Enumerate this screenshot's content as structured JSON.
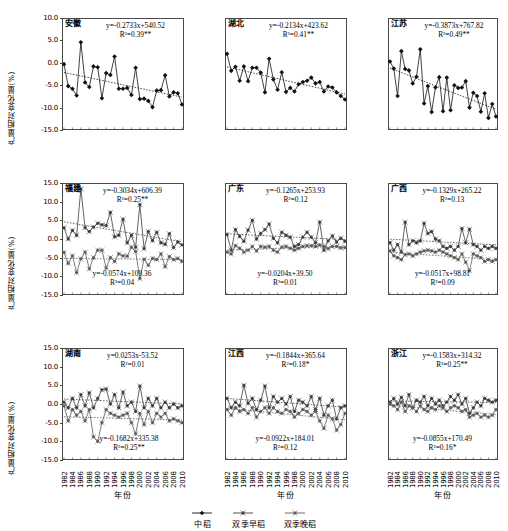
{
  "figure": {
    "y_axis_title": "产量相对变化量(%)",
    "x_axis_title": "年份",
    "y_ticks_top": [
      "10.0",
      "5.0",
      "0.0",
      "-5.0",
      "-10.0",
      "-15.0"
    ],
    "y_ticks_other": [
      "15.0",
      "10.0",
      "5.0",
      "0.0",
      "-5.0",
      "-10.0",
      "-15.0"
    ],
    "x_ticks": [
      "1982",
      "1984",
      "1986",
      "1988",
      "1990",
      "1992",
      "1994",
      "1996",
      "1998",
      "2000",
      "2002",
      "2004",
      "2006",
      "2008",
      "2010"
    ],
    "legend": [
      {
        "label": "中稻",
        "marker": "diamond",
        "color": "#000000"
      },
      {
        "label": "双季早稻",
        "marker": "diamond",
        "color": "#3a3a3a"
      },
      {
        "label": "双季晚稻",
        "marker": "diamond",
        "color": "#5a5a5a"
      }
    ]
  },
  "chart_data": [
    {
      "type": "line",
      "title": "安徽",
      "xlabel": "年份",
      "ylabel": "产量相对变化量(%)",
      "ylim": [
        -15,
        10
      ],
      "xlim": [
        1982,
        2010
      ],
      "grid": false,
      "annotations": [
        {
          "equation": "y=-0.2733x+540.52",
          "r2": "R²=0.39**",
          "position": "top-right"
        }
      ],
      "x": [
        1982,
        1983,
        1984,
        1985,
        1986,
        1987,
        1988,
        1989,
        1990,
        1991,
        1992,
        1993,
        1994,
        1995,
        1996,
        1997,
        1998,
        1999,
        2000,
        2001,
        2002,
        2003,
        2004,
        2005,
        2006,
        2007,
        2008,
        2009,
        2010
      ],
      "series": [
        {
          "name": "中稻",
          "values": [
            -0.3,
            -5.2,
            -5.8,
            -7.3,
            4.6,
            -4.4,
            -5.4,
            -0.8,
            -1.0,
            -7.9,
            -2.3,
            -2.7,
            1.4,
            -5.8,
            -5.8,
            -5.6,
            -7.2,
            -1.1,
            -8.1,
            -8.0,
            -8.5,
            -9.9,
            -6.2,
            -6.1,
            -2.8,
            -7.5,
            -6.6,
            -6.8,
            -9.3
          ]
        }
      ]
    },
    {
      "type": "line",
      "title": "湖北",
      "xlabel": "年份",
      "ylabel": "产量相对变化量(%)",
      "ylim": [
        -15,
        10
      ],
      "xlim": [
        1982,
        2010
      ],
      "grid": false,
      "annotations": [
        {
          "equation": "y=-0.2134x+423.62",
          "r2": "R²=0.41**",
          "position": "top-right"
        }
      ],
      "x": [
        1982,
        1983,
        1984,
        1985,
        1986,
        1987,
        1988,
        1989,
        1990,
        1991,
        1992,
        1993,
        1994,
        1995,
        1996,
        1997,
        1998,
        1999,
        2000,
        2001,
        2002,
        2003,
        2004,
        2005,
        2006,
        2007,
        2008,
        2009,
        2010
      ],
      "series": [
        {
          "name": "中稻",
          "values": [
            2.0,
            -1.8,
            -0.9,
            -4.0,
            -0.8,
            -4.1,
            -1.1,
            -1.1,
            -2.2,
            -6.6,
            0.9,
            -3.7,
            -6.0,
            -2.1,
            -6.5,
            -5.6,
            -6.4,
            -4.8,
            -4.3,
            -4.0,
            -3.3,
            -4.6,
            -4.3,
            -6.4,
            -5.3,
            -5.5,
            -6.6,
            -7.4,
            -8.2
          ]
        }
      ]
    },
    {
      "type": "line",
      "title": "江苏",
      "xlabel": "年份",
      "ylabel": "产量相对变化量(%)",
      "ylim": [
        -15,
        10
      ],
      "xlim": [
        1982,
        2010
      ],
      "grid": false,
      "annotations": [
        {
          "equation": "y=-0.3873x+767.82",
          "r2": "R²=0.49**",
          "position": "top-right"
        }
      ],
      "x": [
        1982,
        1983,
        1984,
        1985,
        1986,
        1987,
        1988,
        1989,
        1990,
        1991,
        1992,
        1993,
        1994,
        1995,
        1996,
        1997,
        1998,
        1999,
        2000,
        2001,
        2002,
        2003,
        2004,
        2005,
        2006,
        2007,
        2008,
        2009,
        2010
      ],
      "series": [
        {
          "name": "中稻",
          "values": [
            0.3,
            -1.3,
            -7.4,
            2.6,
            -1.4,
            -1.7,
            -4.6,
            -3.1,
            3.0,
            -9.1,
            -5.2,
            -11.0,
            -5.5,
            -3.2,
            -10.8,
            -3.3,
            -10.6,
            -5.0,
            -5.6,
            -5.5,
            -4.1,
            -10.0,
            -6.7,
            -7.4,
            -10.9,
            -6.8,
            -12.3,
            -9.2,
            -12.0
          ]
        }
      ]
    },
    {
      "type": "line",
      "title": "福建",
      "xlabel": "年份",
      "ylabel": "产量相对变化量(%)",
      "ylim": [
        -15,
        15
      ],
      "xlim": [
        1982,
        2010
      ],
      "grid": false,
      "annotations": [
        {
          "equation": "y=-0.3034x+606.39",
          "r2": "R²=0.25**",
          "position": "top-right"
        },
        {
          "equation": "y=-0.0574x+109.36",
          "r2": "R²=0.04",
          "position": "bottom-left"
        }
      ],
      "x": [
        1982,
        1983,
        1984,
        1985,
        1986,
        1987,
        1988,
        1989,
        1990,
        1991,
        1992,
        1993,
        1994,
        1995,
        1996,
        1997,
        1998,
        1999,
        2000,
        2001,
        2002,
        2003,
        2004,
        2005,
        2006,
        2007,
        2008,
        2009,
        2010
      ],
      "series": [
        {
          "name": "双季早稻",
          "values": [
            3.0,
            0.0,
            2.3,
            1.0,
            13.4,
            3.0,
            2.0,
            3.2,
            4.2,
            3.8,
            3.6,
            7.1,
            0.6,
            1.0,
            5.3,
            -1.0,
            1.0,
            -2.2,
            9.2,
            -2.6,
            2.0,
            -0.4,
            1.8,
            -1.0,
            -1.4,
            1.4,
            -2.3,
            -0.8,
            -1.6
          ]
        },
        {
          "name": "双季晚稻",
          "values": [
            -3.6,
            -6.5,
            -4.5,
            -9.0,
            -5.3,
            -3.5,
            -8.0,
            -5.0,
            -3.0,
            -3.0,
            -7.8,
            -5.0,
            -6.0,
            -4.0,
            -4.5,
            -4.6,
            -2.2,
            -3.3,
            -10.6,
            -5.4,
            -7.0,
            -5.2,
            -5.5,
            -4.0,
            -7.4,
            -4.7,
            -5.5,
            -5.2,
            -6.0
          ]
        }
      ]
    },
    {
      "type": "line",
      "title": "广东",
      "xlabel": "年份",
      "ylabel": "产量相对变化量(%)",
      "ylim": [
        -15,
        15
      ],
      "xlim": [
        1982,
        2010
      ],
      "grid": false,
      "annotations": [
        {
          "equation": "y=-0.1265x+253.93",
          "r2": "R²=0.12",
          "position": "top-right"
        },
        {
          "equation": "y=-0.0204x+39.50",
          "r2": "R²=0.01",
          "position": "bottom-left"
        }
      ],
      "x": [
        1982,
        1983,
        1984,
        1985,
        1986,
        1987,
        1988,
        1989,
        1990,
        1991,
        1992,
        1993,
        1994,
        1995,
        1996,
        1997,
        1998,
        1999,
        2000,
        2001,
        2002,
        2003,
        2004,
        2005,
        2006,
        2007,
        2008,
        2009,
        2010
      ],
      "series": [
        {
          "name": "双季早稻",
          "values": [
            1.2,
            -3.0,
            2.5,
            0.7,
            -0.6,
            2.4,
            5.0,
            0.0,
            1.5,
            2.5,
            4.0,
            0.2,
            -1.0,
            1.8,
            1.0,
            0.5,
            -2.0,
            -1.5,
            0.5,
            1.8,
            0.5,
            -1.0,
            4.5,
            -3.0,
            -0.5,
            0.8,
            -0.8,
            0.2,
            -0.6
          ]
        },
        {
          "name": "双季晚稻",
          "values": [
            -3.5,
            -4.0,
            -1.8,
            -2.5,
            -3.5,
            -3.0,
            -2.0,
            -3.2,
            -2.0,
            -2.2,
            -2.0,
            -3.0,
            -3.5,
            -2.2,
            -2.0,
            -2.5,
            -3.0,
            -2.5,
            -2.0,
            -1.8,
            -1.8,
            -2.0,
            -1.6,
            -2.0,
            -2.6,
            -2.0,
            -2.0,
            -2.4,
            -2.3
          ]
        }
      ]
    },
    {
      "type": "line",
      "title": "广西",
      "xlabel": "年份",
      "ylabel": "产量相对变化量(%)",
      "ylim": [
        -15,
        15
      ],
      "xlim": [
        1982,
        2010
      ],
      "grid": false,
      "annotations": [
        {
          "equation": "y=-0.1329x+265.22",
          "r2": "R²=0.13",
          "position": "top-right"
        },
        {
          "equation": "y=-0.0517x+98.81",
          "r2": "R²=0.09",
          "position": "bottom-left"
        }
      ],
      "x": [
        1982,
        1983,
        1984,
        1985,
        1986,
        1987,
        1988,
        1989,
        1990,
        1991,
        1992,
        1993,
        1994,
        1995,
        1996,
        1997,
        1998,
        1999,
        2000,
        2001,
        2002,
        2003,
        2004,
        2005,
        2006,
        2007,
        2008,
        2009,
        2010
      ],
      "series": [
        {
          "name": "双季早稻",
          "values": [
            -1.0,
            -3.0,
            -1.5,
            -3.5,
            4.5,
            -1.5,
            -0.5,
            -1.0,
            -0.5,
            4.2,
            1.5,
            2.0,
            0.0,
            -0.5,
            -2.0,
            -2.5,
            -2.0,
            -3.0,
            -2.0,
            2.8,
            -1.0,
            2.6,
            -1.5,
            -2.0,
            -3.0,
            -2.0,
            -2.5,
            -2.0,
            -2.5
          ]
        },
        {
          "name": "双季晚稻",
          "values": [
            -3.2,
            -4.5,
            -5.0,
            -5.5,
            -4.2,
            -4.0,
            -4.5,
            -4.0,
            -3.5,
            -3.2,
            -3.0,
            -3.2,
            -3.5,
            -3.0,
            -3.5,
            -4.0,
            -4.5,
            -5.0,
            -5.5,
            -4.0,
            -6.2,
            -8.5,
            -4.0,
            -4.5,
            -5.0,
            -6.0,
            -5.5,
            -6.0,
            -5.5
          ]
        }
      ]
    },
    {
      "type": "line",
      "title": "湖南",
      "xlabel": "年份",
      "ylabel": "产量相对变化量(%)",
      "ylim": [
        -15,
        15
      ],
      "xlim": [
        1982,
        2010
      ],
      "grid": false,
      "annotations": [
        {
          "equation": "y=0.0253x-53.52",
          "r2": "R²=0.01",
          "position": "top-right"
        },
        {
          "equation": "y=-0.1682x+335.38",
          "r2": "R²=0.25**",
          "position": "bottom-center"
        }
      ],
      "x": [
        1982,
        1983,
        1984,
        1985,
        1986,
        1987,
        1988,
        1989,
        1990,
        1991,
        1992,
        1993,
        1994,
        1995,
        1996,
        1997,
        1998,
        1999,
        2000,
        2001,
        2002,
        2003,
        2004,
        2005,
        2006,
        2007,
        2008,
        2009,
        2010
      ],
      "series": [
        {
          "name": "双季早稻",
          "values": [
            0.5,
            -1.0,
            1.5,
            -1.0,
            2.5,
            -0.5,
            3.0,
            -1.0,
            1.5,
            3.8,
            4.0,
            0.0,
            2.5,
            -1.0,
            3.2,
            -0.5,
            0.5,
            -2.0,
            4.8,
            -1.0,
            1.5,
            -0.5,
            1.5,
            -1.0,
            0.5,
            -1.0,
            0.0,
            -1.0,
            -0.5
          ]
        },
        {
          "name": "双季晚稻",
          "values": [
            -0.5,
            -4.5,
            -1.5,
            -3.0,
            -2.0,
            -4.5,
            -1.5,
            -8.8,
            -10.0,
            -5.0,
            -1.5,
            -2.5,
            -3.0,
            -3.5,
            -3.0,
            -2.5,
            -5.0,
            -8.0,
            -2.5,
            -5.5,
            -2.0,
            -5.0,
            -2.5,
            -3.5,
            -2.5,
            -4.5,
            -4.0,
            -4.5,
            -5.0
          ]
        }
      ]
    },
    {
      "type": "line",
      "title": "江西",
      "xlabel": "年份",
      "ylabel": "产量相对变化量(%)",
      "ylim": [
        -15,
        15
      ],
      "xlim": [
        1982,
        2010
      ],
      "grid": false,
      "annotations": [
        {
          "equation": "y=-0.1844x+365.64",
          "r2": "R²=0.18*",
          "position": "top-right"
        },
        {
          "equation": "y=-0.0922x+184.01",
          "r2": "R²=0.12",
          "position": "bottom-left"
        }
      ],
      "x": [
        1982,
        1983,
        1984,
        1985,
        1986,
        1987,
        1988,
        1989,
        1990,
        1991,
        1992,
        1993,
        1994,
        1995,
        1996,
        1997,
        1998,
        1999,
        2000,
        2001,
        2002,
        2003,
        2004,
        2005,
        2006,
        2007,
        2008,
        2009,
        2010
      ],
      "series": [
        {
          "name": "双季早稻",
          "values": [
            1.5,
            -1.0,
            0.5,
            -0.5,
            5.0,
            0.2,
            1.5,
            -1.5,
            1.0,
            4.8,
            -1.0,
            2.0,
            0.5,
            1.5,
            0.0,
            2.0,
            -2.0,
            1.0,
            0.5,
            -0.5,
            2.0,
            -1.5,
            1.5,
            -3.0,
            -0.5,
            1.0,
            -4.0,
            -1.0,
            -0.5
          ]
        },
        {
          "name": "双季晚稻",
          "values": [
            -1.5,
            -3.0,
            -1.0,
            -2.0,
            -1.5,
            -2.5,
            -1.0,
            -3.5,
            -2.0,
            -1.0,
            -2.5,
            -1.0,
            -2.0,
            -2.5,
            -1.5,
            -2.0,
            -3.5,
            -2.5,
            -1.5,
            -2.0,
            -3.0,
            -2.0,
            -4.5,
            -6.5,
            -3.0,
            -4.0,
            -7.0,
            -5.5,
            -2.5
          ]
        }
      ]
    },
    {
      "type": "line",
      "title": "浙江",
      "xlabel": "年份",
      "ylabel": "产量相对变化量(%)",
      "ylim": [
        -15,
        15
      ],
      "xlim": [
        1982,
        2010
      ],
      "grid": false,
      "annotations": [
        {
          "equation": "y=-0.1583x+314.32",
          "r2": "R²=0.25**",
          "position": "top-right"
        },
        {
          "equation": "y=-0.0855x+170.49",
          "r2": "R²=0.16*",
          "position": "bottom-left"
        }
      ],
      "x": [
        1982,
        1983,
        1984,
        1985,
        1986,
        1987,
        1988,
        1989,
        1990,
        1991,
        1992,
        1993,
        1994,
        1995,
        1996,
        1997,
        1998,
        1999,
        2000,
        2001,
        2002,
        2003,
        2004,
        2005,
        2006,
        2007,
        2008,
        2009,
        2010
      ],
      "series": [
        {
          "name": "双季早稻",
          "values": [
            0.5,
            1.5,
            0.0,
            1.8,
            -0.5,
            2.5,
            -1.0,
            1.0,
            0.5,
            2.0,
            -0.5,
            1.5,
            0.0,
            1.0,
            -0.5,
            0.5,
            2.0,
            1.0,
            2.5,
            0.0,
            1.5,
            -2.5,
            -1.0,
            0.5,
            -0.5,
            1.5,
            1.0,
            0.5,
            1.0
          ]
        },
        {
          "name": "双季晚稻",
          "values": [
            0.0,
            -0.5,
            -1.5,
            0.5,
            -2.0,
            -0.5,
            -1.0,
            -2.0,
            -0.5,
            -1.5,
            -2.0,
            -1.0,
            -1.5,
            -0.5,
            -1.0,
            -2.0,
            -1.0,
            -0.5,
            -1.0,
            -2.0,
            -1.5,
            -3.5,
            -3.0,
            -2.5,
            -3.5,
            -3.0,
            -3.5,
            -3.0,
            -1.5
          ]
        }
      ]
    }
  ]
}
